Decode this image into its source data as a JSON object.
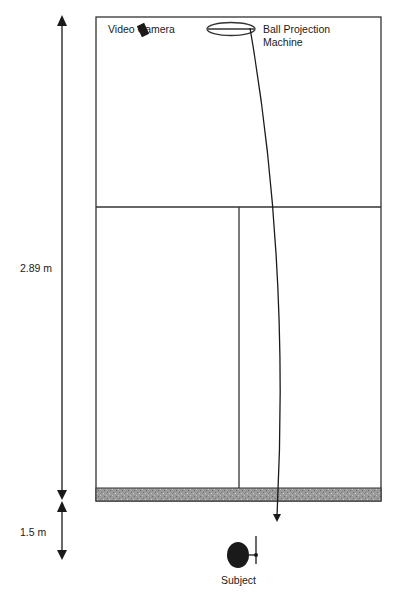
{
  "diagram": {
    "labels": {
      "camera": "Video Camera",
      "machine_line1": "Ball Projection",
      "machine_line2": "Machine",
      "court_length": "2.89 m",
      "subject_distance": "1.5 m",
      "subject": "Subject"
    },
    "colors": {
      "line": "#333333",
      "ink": "#1a1a1a",
      "floor_strip": "#8a8a8a"
    }
  }
}
